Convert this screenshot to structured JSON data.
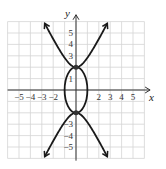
{
  "chart_data": {
    "type": "line",
    "title": "",
    "xlabel": "x",
    "ylabel": "y",
    "xlim": [
      -6,
      6
    ],
    "ylim": [
      -6,
      6
    ],
    "grid": true,
    "x_ticks": [
      "-5",
      "-4",
      "-3",
      "-2",
      "2",
      "3",
      "4",
      "5"
    ],
    "y_ticks": [
      "5",
      "4",
      "3",
      "1",
      "-3",
      "-4",
      "-5"
    ],
    "series": [
      {
        "name": "ellipse",
        "equation": "x^2 + y^2/4 = 1",
        "center": [
          0,
          0
        ],
        "semi_axes": [
          1,
          2
        ]
      },
      {
        "name": "hyperbola",
        "equation": "y^2/4 - x^2 = 1",
        "vertices": [
          [
            0,
            2
          ],
          [
            0,
            -2
          ]
        ],
        "arrow_ends": [
          [
            -2.8,
            6
          ],
          [
            2.8,
            6
          ],
          [
            -2.8,
            -6
          ],
          [
            2.8,
            -6
          ]
        ]
      }
    ],
    "intersection_points": [
      [
        0,
        2
      ],
      [
        0,
        -2
      ]
    ],
    "colors": {
      "curve": "#1a1a1a",
      "grid": "#d0d0d0",
      "axis": "#333333"
    }
  }
}
